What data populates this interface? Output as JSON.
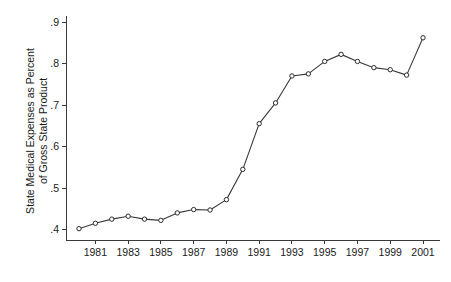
{
  "chart_data": {
    "type": "line",
    "title": "",
    "subtitle": "",
    "xlabel": "",
    "ylabel": "State Medical Expenses as Percent of Gross State Product",
    "ylabel_line1": "State Medical Expenses as Percent",
    "ylabel_line2": "of Gross State Product",
    "x": [
      1980,
      1981,
      1982,
      1983,
      1984,
      1985,
      1986,
      1987,
      1988,
      1989,
      1990,
      1991,
      1992,
      1993,
      1994,
      1995,
      1996,
      1997,
      1998,
      1999,
      2000,
      2001
    ],
    "values": [
      0.402,
      0.415,
      0.425,
      0.432,
      0.425,
      0.422,
      0.44,
      0.448,
      0.447,
      0.472,
      0.545,
      0.655,
      0.705,
      0.77,
      0.775,
      0.805,
      0.822,
      0.805,
      0.79,
      0.785,
      0.772,
      0.862
    ],
    "series": [
      {
        "name": "State Medical Expenses as Percent of Gross State Product",
        "values": [
          0.402,
          0.415,
          0.425,
          0.432,
          0.425,
          0.422,
          0.44,
          0.448,
          0.447,
          0.472,
          0.545,
          0.655,
          0.705,
          0.77,
          0.775,
          0.805,
          0.822,
          0.805,
          0.79,
          0.785,
          0.772,
          0.862
        ]
      }
    ],
    "xlim": [
      1979.5,
      2001.8
    ],
    "ylim": [
      0.385,
      0.915
    ],
    "yticks": [
      0.4,
      0.5,
      0.6,
      0.7,
      0.8,
      0.9
    ],
    "ytick_labels": [
      ".4",
      ".5",
      ".6",
      ".7",
      ".8",
      ".9"
    ],
    "xticks": [
      1981,
      1983,
      1985,
      1987,
      1989,
      1991,
      1993,
      1995,
      1997,
      1999,
      2001
    ],
    "xtick_labels": [
      "1981",
      "1983",
      "1985",
      "1987",
      "1989",
      "1991",
      "1993",
      "1995",
      "1997",
      "1999",
      "2001"
    ],
    "grid": false,
    "legend": "none",
    "marker": "open-circle",
    "line_color": "#3a3a3a",
    "marker_fill": "#ffffff",
    "marker_stroke": "#2b2b2b",
    "background": "#ffffff"
  }
}
